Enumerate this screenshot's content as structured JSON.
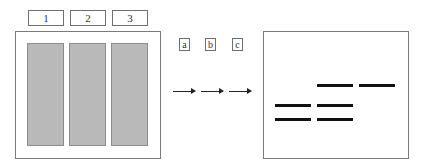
{
  "left_panel": {
    "lane_labels": [
      "1",
      "2",
      "3"
    ],
    "lane_fill_color": "#b9b9b9"
  },
  "steps": {
    "labels": [
      "a",
      "b",
      "c"
    ],
    "arrow_count": 3
  },
  "right_panel": {
    "bands": [
      {
        "lane": 1,
        "row": "middle"
      },
      {
        "lane": 1,
        "row": "bottom"
      },
      {
        "lane": 2,
        "row": "top"
      },
      {
        "lane": 2,
        "row": "middle"
      },
      {
        "lane": 2,
        "row": "bottom"
      },
      {
        "lane": 3,
        "row": "top"
      }
    ],
    "band_color": "#111111"
  }
}
